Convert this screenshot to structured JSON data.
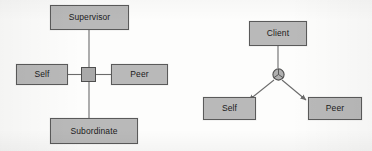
{
  "figure": {
    "type": "node-link-diagram",
    "background_color": "#fdfdfc",
    "node_fill_color": "#b9b9b9",
    "node_border_color": "#5a5a5a",
    "edge_color": "#6b6b6b",
    "text_color": "#1b1b1b"
  },
  "diagrams": [
    {
      "id": "hierarchy-360",
      "layout": "cross",
      "junction": {
        "shape": "square",
        "name": "square-junction"
      },
      "nodes": [
        {
          "id": "supervisor",
          "label": "Supervisor",
          "position": "top"
        },
        {
          "id": "self-left",
          "label": "Self",
          "position": "left"
        },
        {
          "id": "peer-left",
          "label": "Peer",
          "position": "right"
        },
        {
          "id": "subordinate",
          "label": "Subordinate",
          "position": "bottom"
        }
      ],
      "edges": [
        {
          "from": "junction",
          "to": "supervisor",
          "arrow": false
        },
        {
          "from": "junction",
          "to": "self-left",
          "arrow": false
        },
        {
          "from": "junction",
          "to": "peer-left",
          "arrow": false
        },
        {
          "from": "junction",
          "to": "subordinate",
          "arrow": false
        }
      ]
    },
    {
      "id": "client-triad",
      "layout": "y-fork",
      "junction": {
        "shape": "circle",
        "name": "circle-junction"
      },
      "nodes": [
        {
          "id": "client",
          "label": "Client",
          "position": "top"
        },
        {
          "id": "self-right",
          "label": "Self",
          "position": "bottom-left"
        },
        {
          "id": "peer-right",
          "label": "Peer",
          "position": "bottom-right"
        }
      ],
      "edges": [
        {
          "from": "client",
          "to": "junction",
          "arrow": false
        },
        {
          "from": "junction",
          "to": "self-right",
          "arrow": true
        },
        {
          "from": "junction",
          "to": "peer-right",
          "arrow": true
        }
      ]
    }
  ]
}
